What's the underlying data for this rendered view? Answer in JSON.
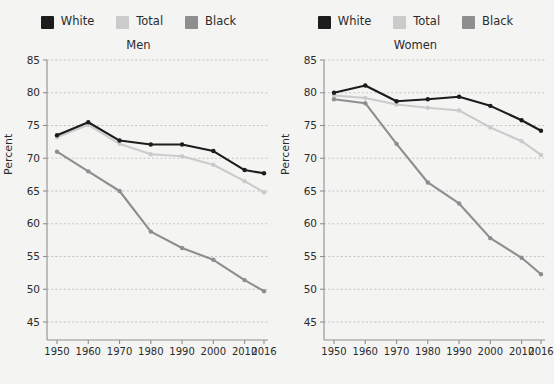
{
  "chart_data": [
    {
      "type": "line",
      "title": "Men",
      "xlabel": "",
      "ylabel": "Percent",
      "ylim": [
        45,
        85
      ],
      "yticks": [
        45,
        50,
        55,
        60,
        65,
        70,
        75,
        80,
        85
      ],
      "x": [
        1950,
        1960,
        1970,
        1980,
        1990,
        2000,
        2010,
        2016
      ],
      "xticklabels": [
        "1950",
        "1960",
        "1970",
        "1980",
        "1990",
        "2000",
        "2010",
        "2016"
      ],
      "grid": true,
      "legend_position": "top-center",
      "series": [
        {
          "name": "White",
          "color": "#1c1c1c",
          "values": [
            73.5,
            75.5,
            72.7,
            72.1,
            72.1,
            71.1,
            68.2,
            67.7
          ]
        },
        {
          "name": "Total",
          "color": "#cbcbcb",
          "values": [
            73.2,
            75.1,
            72.2,
            70.6,
            70.3,
            69.0,
            66.5,
            64.8
          ]
        },
        {
          "name": "Black",
          "color": "#8e8e8e",
          "values": [
            71.0,
            68.0,
            65.0,
            58.8,
            56.3,
            54.5,
            51.4,
            49.7
          ]
        }
      ]
    },
    {
      "type": "line",
      "title": "Women",
      "xlabel": "",
      "ylabel": "Percent",
      "ylim": [
        45,
        85
      ],
      "yticks": [
        45,
        50,
        55,
        60,
        65,
        70,
        75,
        80,
        85
      ],
      "x": [
        1950,
        1960,
        1970,
        1980,
        1990,
        2000,
        2010,
        2016
      ],
      "xticklabels": [
        "1950",
        "1960",
        "1970",
        "1980",
        "1990",
        "2000",
        "2010",
        "2016"
      ],
      "grid": true,
      "legend_position": "top-center",
      "series": [
        {
          "name": "White",
          "color": "#1c1c1c",
          "values": [
            80.0,
            81.1,
            78.7,
            79.0,
            79.4,
            78.0,
            75.8,
            74.2
          ]
        },
        {
          "name": "Total",
          "color": "#cbcbcb",
          "values": [
            79.6,
            79.2,
            78.2,
            77.7,
            77.3,
            74.7,
            72.6,
            70.5
          ]
        },
        {
          "name": "Black",
          "color": "#8e8e8e",
          "values": [
            79.0,
            78.4,
            72.2,
            66.3,
            63.1,
            57.8,
            54.8,
            52.3
          ]
        }
      ]
    }
  ],
  "panels": [
    {
      "title": "Men",
      "ylabel": "Percent",
      "legend": [
        {
          "label": "White",
          "color": "#1c1c1c"
        },
        {
          "label": "Total",
          "color": "#cbcbcb"
        },
        {
          "label": "Black",
          "color": "#8e8e8e"
        }
      ]
    },
    {
      "title": "Women",
      "ylabel": "Percent",
      "legend": [
        {
          "label": "White",
          "color": "#1c1c1c"
        },
        {
          "label": "Total",
          "color": "#cbcbcb"
        },
        {
          "label": "Black",
          "color": "#8e8e8e"
        }
      ]
    }
  ],
  "colors": {
    "background": "#f4f4f3",
    "axis": "#8f8f8f",
    "grid": "#b9b9b9",
    "text": "#2b2b2b"
  }
}
